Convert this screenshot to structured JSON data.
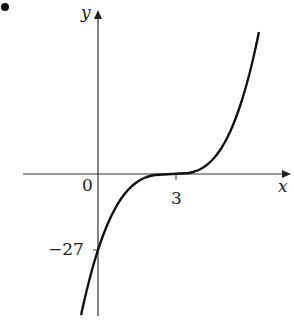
{
  "chart_data": {
    "type": "line",
    "title": "",
    "xlabel": "x",
    "ylabel": "y",
    "series": [
      {
        "name": "y = (x - 3)^3",
        "x": [
          -0.5,
          0,
          1,
          2,
          3,
          4,
          5,
          6,
          6.4
        ],
        "y": [
          -42.9,
          -27,
          -8,
          -1,
          0,
          1,
          8,
          27,
          39.3
        ]
      }
    ],
    "annotations": [
      {
        "label": "0",
        "at": "origin"
      },
      {
        "label": "3",
        "at": "x-intercept",
        "x": 3,
        "y": 0
      },
      {
        "label": "−27",
        "at": "y-intercept",
        "x": 0,
        "y": -27
      }
    ],
    "grid": false,
    "legend": "none"
  },
  "labels": {
    "y_axis": "y",
    "x_axis": "x",
    "origin": "0",
    "x_intercept": "3",
    "y_intercept": "−27"
  },
  "bullet": "•",
  "colors": {
    "curve": "#111111",
    "axis": "#333333"
  }
}
